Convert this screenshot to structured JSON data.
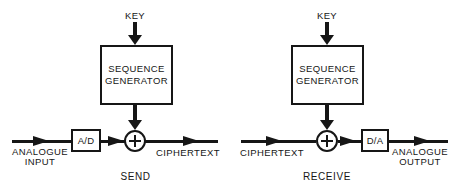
{
  "figure": {
    "background_color": "#ffffff",
    "ink_color": "#161616",
    "send": {
      "key_label": "KEY",
      "generator_line1": "SEQUENCE",
      "generator_line2": "GENERATOR",
      "converter_label": "A/D",
      "adder_symbol": "+",
      "input_line1": "ANALOGUE",
      "input_line2": "INPUT",
      "output_label": "CIPHERTEXT",
      "caption": "SEND"
    },
    "receive": {
      "key_label": "KEY",
      "generator_line1": "SEQUENCE",
      "generator_line2": "GENERATOR",
      "converter_label": "D/A",
      "adder_symbol": "+",
      "input_label": "CIPHERTEXT",
      "output_line1": "ANALOGUE",
      "output_line2": "OUTPUT",
      "caption": "RECEIVE"
    }
  }
}
